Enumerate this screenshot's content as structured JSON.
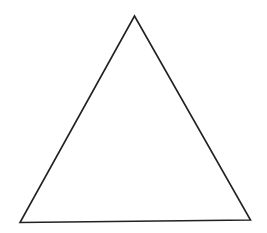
{
  "diagram": {
    "shape": "triangle",
    "vertices": {
      "apex": [
        134.5,
        16
      ],
      "bottom_left": [
        20,
        222.5
      ],
      "bottom_right": [
        250.5,
        220
      ]
    },
    "stroke_color": "#222222",
    "fill_color": "#ffffff",
    "stroke_width": 1.6
  }
}
